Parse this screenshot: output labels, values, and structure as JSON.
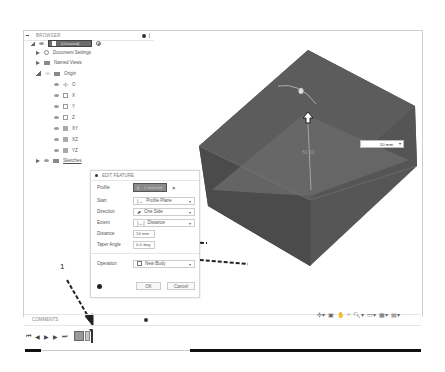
{
  "browser": {
    "title": "BROWSER",
    "root": {
      "label": "(Unsaved)"
    },
    "items": [
      {
        "label": "Document Settings",
        "icon": "gear-icon"
      },
      {
        "label": "Named Views",
        "icon": "folder-icon"
      },
      {
        "label": "Origin",
        "icon": "folder-icon"
      },
      {
        "label": "O",
        "icon": "origin-point-icon"
      },
      {
        "label": "X",
        "icon": "axis-icon"
      },
      {
        "label": "Y",
        "icon": "axis-icon"
      },
      {
        "label": "Z",
        "icon": "axis-icon"
      },
      {
        "label": "XY",
        "icon": "plane-icon"
      },
      {
        "label": "XZ",
        "icon": "plane-icon"
      },
      {
        "label": "YZ",
        "icon": "plane-icon"
      },
      {
        "label": "Sketches",
        "icon": "folder-icon"
      }
    ]
  },
  "edit_feature": {
    "title": "EDIT FEATURE",
    "rows": {
      "profile": {
        "label": "Profile",
        "value": "1 selected"
      },
      "start": {
        "label": "Start",
        "value": "Profile Plane"
      },
      "direction": {
        "label": "Direction",
        "value": "One Side"
      },
      "extent": {
        "label": "Extent",
        "value": "Distance"
      },
      "distance": {
        "label": "Distance",
        "value": "10 mm"
      },
      "taper": {
        "label": "Taper Angle",
        "value": "0.0 deg"
      },
      "operation": {
        "label": "Operation",
        "value": "New Body"
      }
    },
    "ok_label": "OK",
    "cancel_label": "Cancel"
  },
  "viewport": {
    "dimension_value": "10 mm",
    "sketch_label": "50.00",
    "body_color": "#555555"
  },
  "comments": {
    "title": "COMMENTS"
  },
  "annotation": {
    "step_number": "1"
  },
  "close_glyph": "×",
  "dropdown_glyph": "▾"
}
